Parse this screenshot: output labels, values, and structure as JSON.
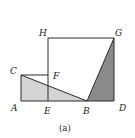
{
  "diagram": {
    "caption": "(a)",
    "points": {
      "A": {
        "label": "A",
        "x": 21,
        "y": 101
      },
      "B": {
        "label": "B",
        "x": 87,
        "y": 101
      },
      "C": {
        "label": "C",
        "x": 21,
        "y": 75
      },
      "D": {
        "label": "D",
        "x": 114,
        "y": 101
      },
      "E": {
        "label": "E",
        "x": 48,
        "y": 101
      },
      "F": {
        "label": "F",
        "x": 48,
        "y": 75
      },
      "G": {
        "label": "G",
        "x": 114,
        "y": 38
      },
      "H": {
        "label": "H",
        "x": 48,
        "y": 38
      }
    },
    "colors": {
      "stroke": "#2a2a2a",
      "light_fill": "#d4d4d4",
      "dark_fill": "#8a8a8a",
      "background": "#ffffff"
    }
  }
}
